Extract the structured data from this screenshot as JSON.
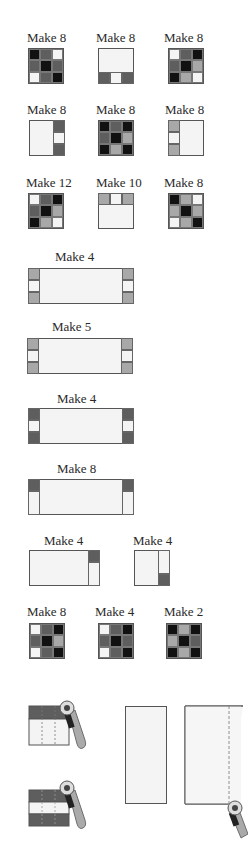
{
  "colors": {
    "black": "#111111",
    "dark": "#5e5e5e",
    "medium": "#a8a8a8",
    "light": "#f4f4f4",
    "outline": "#555555"
  },
  "row1": {
    "labels": [
      "Make 8",
      "Make 8",
      "Make 8"
    ],
    "grids": [
      [
        "black",
        "dark",
        "light",
        "dark",
        "black",
        "dark",
        "light",
        "dark",
        "black"
      ],
      null,
      [
        "light",
        "dark",
        "black",
        "dark",
        "black",
        "medium",
        "black",
        "medium",
        "light"
      ]
    ]
  },
  "row2": {
    "labels": [
      "Make 8",
      "Make 8",
      "Make 8"
    ],
    "grids": [
      null,
      [
        "black",
        "dark",
        "black",
        "dark",
        "black",
        "medium",
        "black",
        "medium",
        "black"
      ],
      null
    ]
  },
  "row3": {
    "labels": [
      "Make 12",
      "Make 10",
      "Make 8"
    ],
    "grids": [
      [
        "light",
        "dark",
        "black",
        "dark",
        "black",
        "medium",
        "black",
        "medium",
        "light"
      ],
      null,
      [
        "black",
        "medium",
        "light",
        "medium",
        "black",
        "medium",
        "light",
        "medium",
        "black"
      ]
    ]
  },
  "strips": [
    {
      "label": "Make 4"
    },
    {
      "label": "Make 5"
    },
    {
      "label": "Make 4"
    },
    {
      "label": "Make 8"
    }
  ],
  "row_rect": {
    "labels": [
      "Make 4",
      "Make 4"
    ]
  },
  "row_last": {
    "labels": [
      "Make 8",
      "Make 4",
      "Make 2"
    ],
    "grids": [
      [
        "light",
        "dark",
        "black",
        "dark",
        "black",
        "medium",
        "light",
        "dark",
        "black"
      ],
      [
        "light",
        "dark",
        "black",
        "dark",
        "black",
        "dark",
        "light",
        "dark",
        "black"
      ],
      [
        "black",
        "medium",
        "black",
        "medium",
        "black",
        "dark",
        "black",
        "medium",
        "black"
      ]
    ]
  },
  "cutting_illustrations": [
    {
      "description": "rotary cutter cutting strip set (one dark strip)"
    },
    {
      "description": "rotary cutter cutting strip set (dark-light-dark)"
    },
    {
      "description": "plain rectangle"
    },
    {
      "description": "rectangle with dashed cut line and rotary cutter"
    }
  ]
}
